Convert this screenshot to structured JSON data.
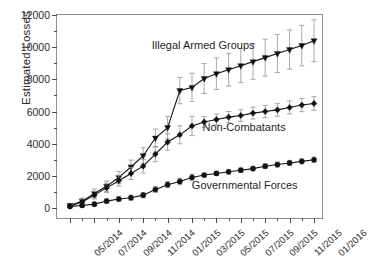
{
  "chart_data": {
    "type": "line",
    "title": "",
    "xlabel": "",
    "ylabel": "Estimated Losses",
    "ylim": [
      0,
      12000
    ],
    "ytick_values": [
      0,
      2000,
      4000,
      6000,
      8000,
      10000,
      12000
    ],
    "ytick_labels": [
      "0",
      "2000",
      "4000",
      "6000",
      "8000",
      "10000",
      "12000"
    ],
    "yminor_step": 1000,
    "grid": false,
    "legend_position": "inline-annotation",
    "error_bars": true,
    "x": [
      "05/2014",
      "06/2014",
      "07/2014",
      "08/2014",
      "09/2014",
      "10/2014",
      "11/2014",
      "12/2014",
      "01/2015",
      "02/2015",
      "03/2015",
      "04/2015",
      "05/2015",
      "06/2015",
      "07/2015",
      "08/2015",
      "09/2015",
      "10/2015",
      "11/2015",
      "12/2015",
      "01/2016"
    ],
    "xtick_labels": [
      "05/2014",
      "07/2014",
      "09/2014",
      "11/2014",
      "01/2015",
      "03/2015",
      "05/2015",
      "07/2015",
      "09/2015",
      "11/2015",
      "01/2016"
    ],
    "xtick_label_step": 2,
    "series": [
      {
        "name": "Illegal Armed Groups",
        "marker": "triangle-down",
        "values": [
          150,
          420,
          900,
          1350,
          1900,
          2550,
          3250,
          4350,
          5000,
          7300,
          7500,
          8050,
          8350,
          8600,
          8850,
          9100,
          9350,
          9600,
          9850,
          10100,
          10400
        ],
        "errors": [
          120,
          200,
          280,
          330,
          380,
          430,
          500,
          560,
          700,
          820,
          880,
          930,
          980,
          1020,
          1060,
          1100,
          1150,
          1180,
          1220,
          1260,
          1300
        ]
      },
      {
        "name": "Non-Combatants",
        "marker": "diamond",
        "values": [
          120,
          380,
          800,
          1250,
          1700,
          2150,
          2600,
          3350,
          4100,
          4550,
          5100,
          5350,
          5500,
          5650,
          5750,
          5900,
          6000,
          6100,
          6250,
          6400,
          6500
        ],
        "errors": [
          110,
          180,
          240,
          290,
          330,
          380,
          420,
          470,
          520,
          560,
          600,
          330,
          340,
          350,
          360,
          370,
          380,
          390,
          400,
          410,
          420
        ]
      },
      {
        "name": "Governmental Forces",
        "marker": "circle",
        "values": [
          100,
          160,
          240,
          430,
          560,
          640,
          800,
          1150,
          1450,
          1650,
          1900,
          2050,
          2150,
          2250,
          2350,
          2450,
          2600,
          2700,
          2800,
          2900,
          3000
        ],
        "errors": [
          80,
          100,
          120,
          140,
          150,
          160,
          170,
          180,
          190,
          200,
          210,
          120,
          130,
          130,
          140,
          140,
          150,
          155,
          160,
          165,
          170
        ]
      }
    ],
    "annotations": [
      {
        "text": "Illegal Armed Groups",
        "x_frac": 0.355,
        "y_value": 10050
      },
      {
        "text": "Non-Combatants",
        "x_frac": 0.545,
        "y_value": 5000
      },
      {
        "text": "Governmental Forces",
        "x_frac": 0.505,
        "y_value": 1350
      }
    ]
  }
}
